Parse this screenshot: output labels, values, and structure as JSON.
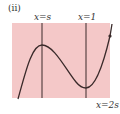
{
  "figure": {
    "panel_label": "(ii)",
    "lines": [
      {
        "label": "x=s"
      },
      {
        "label": "x=1"
      }
    ],
    "bottom_label": "x=2s",
    "colors": {
      "region_fill": "#f4c8c8",
      "curve": "#3a2a2a",
      "lines": "#3a2a2a"
    }
  }
}
